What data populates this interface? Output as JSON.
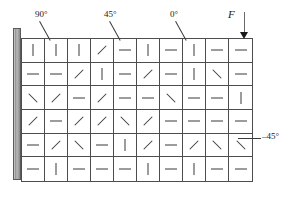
{
  "figure": {
    "support": {
      "name": "fixed-support-wall"
    }
  },
  "annotations": [
    {
      "id": "label-90",
      "text": "90°",
      "leader": "leader-90"
    },
    {
      "id": "label-45",
      "text": "45°",
      "leader": "leader-45"
    },
    {
      "id": "label-0",
      "text": "0°",
      "leader": "leader-0"
    },
    {
      "id": "label-m45",
      "text": "–45°",
      "leader": "leader-m45"
    },
    {
      "id": "label-F",
      "text": "F",
      "leader": null
    }
  ],
  "force": {
    "symbol": "F",
    "direction": "down",
    "applied_at": "top-right-corner"
  },
  "grid": {
    "columns": 10,
    "rows": 6,
    "angle_legend": {
      "a0": "0°",
      "a45": "45°",
      "a90": "90°",
      "am45": "–45°"
    },
    "cells": [
      [
        "a90",
        "a90",
        "a90",
        "a45",
        "a0",
        "a90",
        "a0",
        "a90",
        "a0",
        "a0"
      ],
      [
        "a0",
        "a0",
        "a45",
        "a90",
        "a0",
        "a45",
        "a0",
        "a90",
        "am45",
        "a0"
      ],
      [
        "am45",
        "a45",
        "a0",
        "a45",
        "a0",
        "a0",
        "am45",
        "a0",
        "a0",
        "a90"
      ],
      [
        "a45",
        "a0",
        "a45",
        "a45",
        "am45",
        "a45",
        "a0",
        "a0",
        "a0",
        "a0"
      ],
      [
        "a0",
        "a45",
        "am45",
        "a0",
        "a90",
        "a45",
        "a0",
        "a45",
        "am45",
        "am45"
      ],
      [
        "a0",
        "a90",
        "a0",
        "a0",
        "a0",
        "a90",
        "a0",
        "a90",
        "a0",
        "a0"
      ]
    ]
  },
  "colors": {
    "line": "#4d4d4d",
    "mark": "#3a3a3a",
    "support": "#8d8d8d",
    "text": "#1a1a1a"
  }
}
